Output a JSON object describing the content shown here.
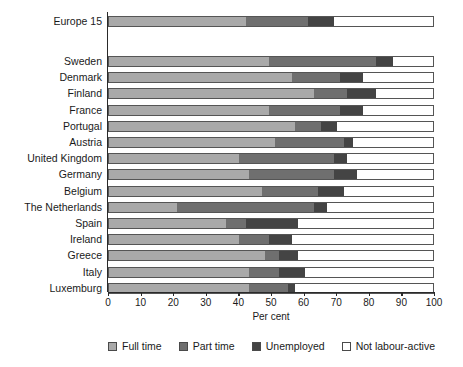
{
  "chart_data": {
    "type": "bar",
    "orientation": "horizontal",
    "stacked": true,
    "title": "",
    "xlabel": "Per cent",
    "ylabel": "",
    "xlim": [
      0,
      100
    ],
    "xticks": [
      0,
      10,
      20,
      30,
      40,
      50,
      60,
      70,
      80,
      90,
      100
    ],
    "grid": false,
    "legend_position": "bottom",
    "categories": [
      "Europe 15",
      "Sweden",
      "Denmark",
      "Finland",
      "France",
      "Portugal",
      "Austria",
      "United Kingdom",
      "Germany",
      "Belgium",
      "The Netherlands",
      "Spain",
      "Ireland",
      "Greece",
      "Italy",
      "Luxemburg"
    ],
    "series": [
      {
        "name": "Full time",
        "color": "#a9a9a9",
        "values": [
          42,
          49,
          56,
          63,
          49,
          57,
          51,
          40,
          43,
          47,
          21,
          36,
          40,
          48,
          43,
          43
        ]
      },
      {
        "name": "Part time",
        "color": "#6f6f6f",
        "values": [
          19,
          33,
          15,
          10,
          22,
          8,
          21,
          29,
          26,
          17,
          42,
          6,
          9,
          4,
          9,
          12
        ]
      },
      {
        "name": "Unemployed",
        "color": "#444444",
        "values": [
          8,
          5,
          7,
          9,
          7,
          5,
          3,
          4,
          7,
          8,
          4,
          16,
          7,
          6,
          8,
          2
        ]
      },
      {
        "name": "Not labour-active",
        "color": "#ffffff",
        "values": [
          31,
          13,
          22,
          18,
          22,
          30,
          25,
          27,
          24,
          28,
          33,
          42,
          44,
          42,
          40,
          43
        ]
      }
    ]
  },
  "legend": {
    "items": [
      {
        "label": "Full time",
        "color": "#a9a9a9"
      },
      {
        "label": "Part time",
        "color": "#6f6f6f"
      },
      {
        "label": "Unemployed",
        "color": "#444444"
      },
      {
        "label": "Not labour-active",
        "color": "#ffffff"
      }
    ]
  }
}
